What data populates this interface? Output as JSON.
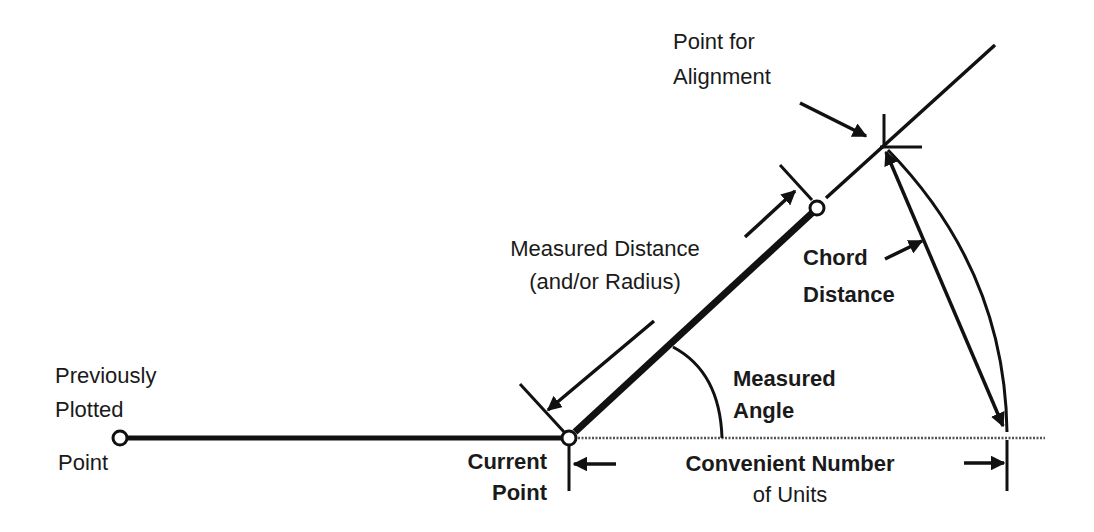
{
  "diagram": {
    "type": "surveying-plot-construction",
    "labels": {
      "previous_point": [
        "Previously",
        "Plotted"
      ],
      "previous_point_suffix": "Point",
      "current_point": [
        "Current",
        "Point"
      ],
      "alignment_point": [
        "Point for",
        "Alignment"
      ],
      "measured_distance": [
        "Measured Distance",
        "(and/or  Radius)"
      ],
      "chord_distance": [
        "Chord",
        "Distance"
      ],
      "measured_angle": [
        "Measured",
        "Angle"
      ],
      "convenient_units": [
        "Convenient Number",
        "of Units"
      ]
    },
    "colors": {
      "line": "#111111",
      "background": "#ffffff",
      "dotted_baseline": "#555555"
    }
  }
}
